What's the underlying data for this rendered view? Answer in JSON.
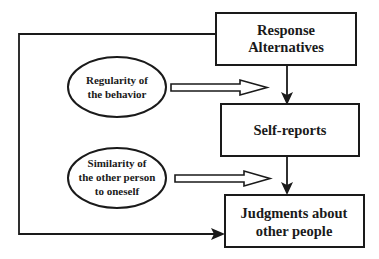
{
  "diagram": {
    "nodes": {
      "response_alternatives": {
        "line1": "Response",
        "line2": "Alternatives"
      },
      "self_reports": {
        "line1": "Self-reports"
      },
      "judgments": {
        "line1": "Judgments about",
        "line2": "other people"
      },
      "regularity": {
        "line1": "Regularity of",
        "line2": "the behavior"
      },
      "similarity": {
        "line1": "Similarity of",
        "line2": "the other person",
        "line3": "to oneself"
      }
    },
    "edges": [
      {
        "from": "Response Alternatives",
        "to": "Self-reports",
        "style": "solid-arrow"
      },
      {
        "from": "Self-reports",
        "to": "Judgments about other people",
        "style": "solid-arrow"
      },
      {
        "from": "Response Alternatives",
        "to": "Judgments about other people",
        "style": "elbow-solid-arrow"
      },
      {
        "from": "Regularity of the behavior",
        "to": "Response Alternatives -> Self-reports link",
        "style": "hollow-arrow"
      },
      {
        "from": "Similarity of the other person to oneself",
        "to": "Self-reports -> Judgments link",
        "style": "hollow-arrow"
      }
    ],
    "colors": {
      "stroke": "#1a1a1a",
      "background": "#ffffff"
    }
  }
}
